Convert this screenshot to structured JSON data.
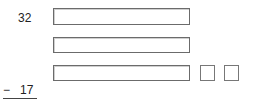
{
  "problem": {
    "top_number": "32",
    "operator": "−",
    "bottom_number": "17"
  },
  "answer_boxes": [
    {
      "value": ""
    },
    {
      "value": ""
    },
    {
      "value": ""
    }
  ],
  "small_boxes": [
    {
      "value": ""
    },
    {
      "value": ""
    }
  ]
}
